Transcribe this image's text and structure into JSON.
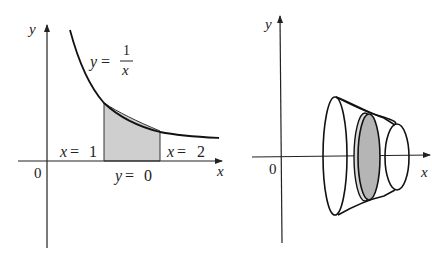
{
  "left_panel": {
    "axis_labels": {
      "x": "x",
      "y": "y",
      "origin": "0"
    },
    "curve_label": {
      "lhs": "y",
      "eq": "=",
      "numerator": "1",
      "denominator": "x"
    },
    "bounds": {
      "left": {
        "var": "x",
        "eq": "=",
        "value": "1"
      },
      "right": {
        "var": "x",
        "eq": "=",
        "value": "2"
      },
      "bottom": {
        "var": "y",
        "eq": "=",
        "value": "0"
      }
    },
    "colors": {
      "shade": "#c8c8c8",
      "stroke": "#222222"
    }
  },
  "right_panel": {
    "axis_labels": {
      "x": "x",
      "y": "y",
      "origin": "0"
    },
    "solid": "solid of revolution about x-axis with shaded cross-sectional disk",
    "colors": {
      "disk": "#b5b5b5",
      "stroke": "#111111"
    }
  }
}
